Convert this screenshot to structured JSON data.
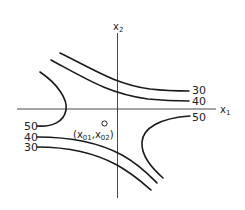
{
  "diagram": {
    "type": "contour-saddle",
    "axes": {
      "x_label": "x",
      "x_sub": "1",
      "y_label": "x",
      "y_sub": "2"
    },
    "contours": [
      {
        "id": "upper-30",
        "label": "30"
      },
      {
        "id": "upper-40",
        "label": "40"
      },
      {
        "id": "right-50",
        "label": "50"
      },
      {
        "id": "left-50",
        "label": "50"
      },
      {
        "id": "lower-40",
        "label": "40"
      },
      {
        "id": "lower-30",
        "label": "30"
      }
    ],
    "point": {
      "label": "(x01,x02)",
      "label_parts": {
        "open": "(x",
        "s1": "01",
        "mid": ",x",
        "s2": "02",
        "close": ")"
      }
    },
    "colors": {
      "line": "#1a1a1a",
      "background": "#ffffff"
    }
  }
}
